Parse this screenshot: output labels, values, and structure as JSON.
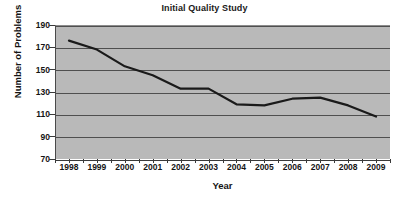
{
  "chart_data": {
    "type": "line",
    "title": "Initial Quality Study",
    "xlabel": "Year",
    "ylabel": "Number of Problems",
    "categories": [
      "1998",
      "1999",
      "2000",
      "2001",
      "2002",
      "2003",
      "2004",
      "2005",
      "2006",
      "2007",
      "2008",
      "2009"
    ],
    "values": [
      176,
      168,
      153,
      145,
      133,
      133,
      119,
      118,
      124,
      125,
      118,
      108
    ],
    "series": [
      {
        "name": "Number of Problems",
        "values": [
          176,
          168,
          153,
          145,
          133,
          133,
          119,
          118,
          124,
          125,
          118,
          108
        ]
      }
    ],
    "ylim": [
      70,
      190
    ],
    "yticks": [
      190,
      170,
      150,
      130,
      110,
      90,
      70
    ],
    "ytick_labels": [
      "190",
      "170",
      "150",
      "130",
      "110",
      "90",
      "70"
    ],
    "xtick_labels": [
      "1998",
      "1999",
      "2000",
      "2001",
      "2002",
      "2003",
      "2004",
      "2005",
      "2006",
      "2007",
      "2008",
      "2009"
    ],
    "grid": true,
    "legend": false,
    "legend_position": "none",
    "plot_background_color": "#b9b9b9",
    "line_color": "#1a1a1a",
    "gridline_color": "#4f4f4f",
    "figure_background_color": "#ffffff"
  }
}
